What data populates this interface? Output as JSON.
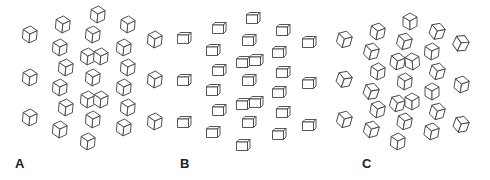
{
  "figure": {
    "stroke_color": "#444444",
    "background": "#ffffff",
    "panels": [
      {
        "label": "A",
        "style": "rotated-45",
        "label_pos": [
          15,
          168
        ],
        "cubes": [
          [
            30,
            35,
            -40
          ],
          [
            30,
            78,
            -40
          ],
          [
            30,
            118,
            -40
          ],
          [
            63,
            25,
            -40
          ],
          [
            60,
            48,
            -40
          ],
          [
            66,
            68,
            -40
          ],
          [
            60,
            88,
            -40
          ],
          [
            66,
            108,
            -40
          ],
          [
            60,
            130,
            -40
          ],
          [
            98,
            15,
            -40
          ],
          [
            93,
            35,
            -40
          ],
          [
            88,
            57,
            -40
          ],
          [
            101,
            57,
            -40
          ],
          [
            93,
            78,
            -40
          ],
          [
            88,
            100,
            -40
          ],
          [
            101,
            100,
            -40
          ],
          [
            93,
            120,
            -40
          ],
          [
            88,
            142,
            -40
          ],
          [
            128,
            25,
            -40
          ],
          [
            124,
            48,
            -40
          ],
          [
            128,
            68,
            -40
          ],
          [
            124,
            88,
            -40
          ],
          [
            128,
            108,
            -40
          ],
          [
            124,
            128,
            -40
          ],
          [
            155,
            40,
            -40
          ],
          [
            155,
            80,
            -40
          ],
          [
            155,
            122,
            -40
          ]
        ]
      },
      {
        "label": "B",
        "style": "frontal",
        "label_pos": [
          180,
          168
        ],
        "cubes": [
          [
            183,
            38,
            0
          ],
          [
            183,
            80,
            0
          ],
          [
            183,
            122,
            0
          ],
          [
            218,
            28,
            0
          ],
          [
            212,
            50,
            0
          ],
          [
            218,
            70,
            0
          ],
          [
            212,
            90,
            0
          ],
          [
            218,
            110,
            0
          ],
          [
            212,
            132,
            0
          ],
          [
            252,
            18,
            0
          ],
          [
            248,
            40,
            0
          ],
          [
            242,
            62,
            0
          ],
          [
            255,
            60,
            0
          ],
          [
            248,
            80,
            0
          ],
          [
            242,
            104,
            0
          ],
          [
            255,
            102,
            0
          ],
          [
            248,
            122,
            0
          ],
          [
            242,
            145,
            0
          ],
          [
            282,
            30,
            0
          ],
          [
            278,
            52,
            0
          ],
          [
            282,
            72,
            0
          ],
          [
            278,
            92,
            0
          ],
          [
            282,
            112,
            0
          ],
          [
            278,
            134,
            0
          ],
          [
            308,
            42,
            0
          ],
          [
            308,
            83,
            0
          ],
          [
            308,
            125,
            0
          ]
        ]
      },
      {
        "label": "C",
        "style": "varied",
        "label_pos": [
          362,
          168
        ],
        "cubes": [
          [
            345,
            40,
            -30
          ],
          [
            345,
            80,
            -25
          ],
          [
            345,
            120,
            -30
          ],
          [
            378,
            32,
            -35
          ],
          [
            372,
            52,
            -30
          ],
          [
            378,
            72,
            -40
          ],
          [
            372,
            92,
            -25
          ],
          [
            378,
            110,
            -35
          ],
          [
            372,
            130,
            -30
          ],
          [
            410,
            22,
            -45
          ],
          [
            405,
            42,
            -30
          ],
          [
            398,
            62,
            -35
          ],
          [
            412,
            62,
            -50
          ],
          [
            405,
            82,
            -40
          ],
          [
            398,
            104,
            -30
          ],
          [
            412,
            102,
            -45
          ],
          [
            405,
            122,
            -35
          ],
          [
            398,
            142,
            -40
          ],
          [
            438,
            32,
            -25
          ],
          [
            432,
            52,
            -40
          ],
          [
            438,
            72,
            -30
          ],
          [
            432,
            92,
            -45
          ],
          [
            438,
            112,
            -30
          ],
          [
            432,
            132,
            -35
          ],
          [
            462,
            44,
            -20
          ],
          [
            462,
            85,
            -35
          ],
          [
            462,
            125,
            -25
          ]
        ]
      }
    ]
  }
}
